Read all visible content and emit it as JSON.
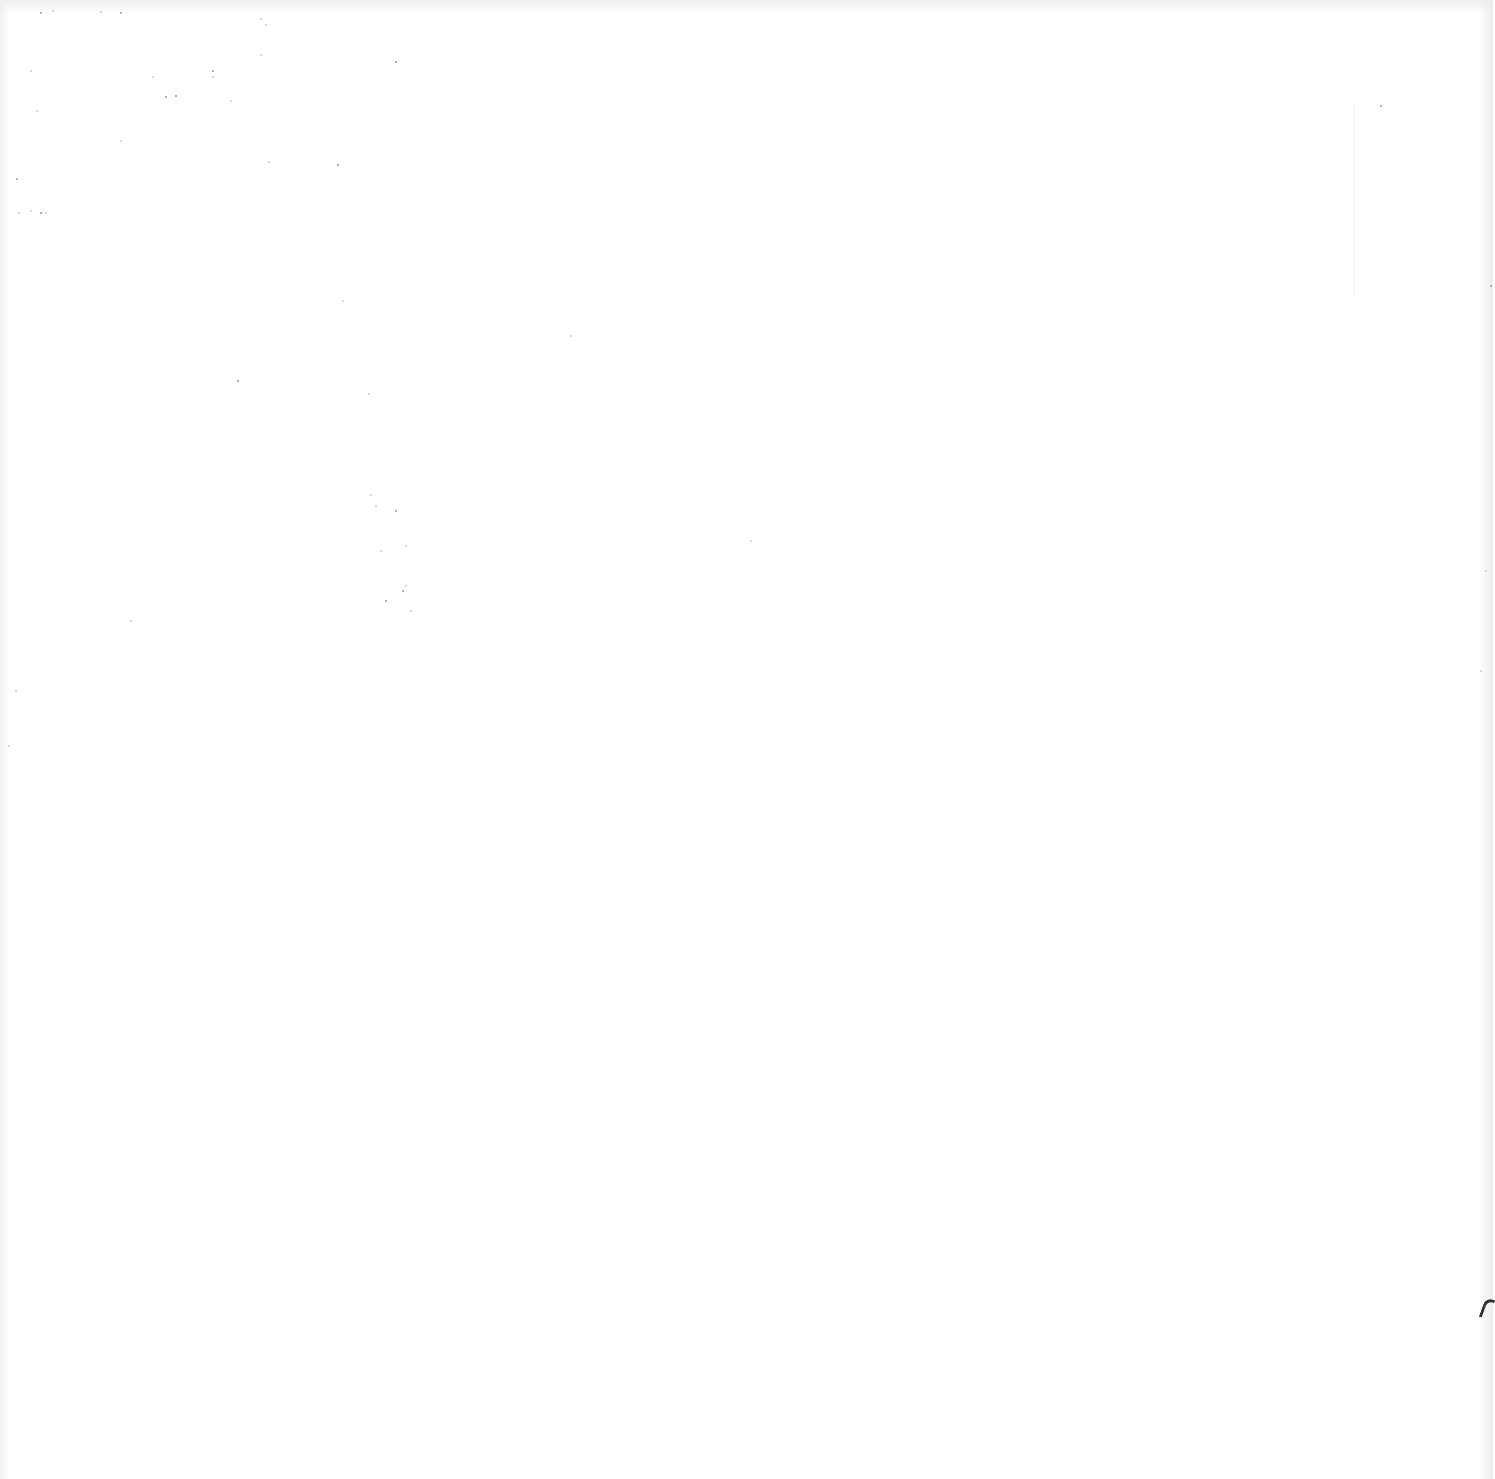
{
  "page": {
    "type": "blank scanned page",
    "text_content": ""
  },
  "artifacts": {
    "specks": [
      [
        40,
        12
      ],
      [
        52,
        10
      ],
      [
        100,
        11
      ],
      [
        120,
        12
      ],
      [
        260,
        18
      ],
      [
        265,
        24
      ],
      [
        395,
        61
      ],
      [
        260,
        54
      ],
      [
        230,
        100
      ],
      [
        175,
        95
      ],
      [
        120,
        140
      ],
      [
        268,
        161
      ],
      [
        337,
        164
      ],
      [
        342,
        300
      ],
      [
        368,
        393
      ],
      [
        237,
        380
      ],
      [
        30,
        70
      ],
      [
        36,
        110
      ],
      [
        16,
        178
      ],
      [
        18,
        212
      ],
      [
        30,
        210
      ],
      [
        40,
        212
      ],
      [
        45,
        212
      ],
      [
        130,
        620
      ],
      [
        212,
        70
      ],
      [
        212,
        76
      ],
      [
        152,
        76
      ],
      [
        165,
        96
      ],
      [
        370,
        494
      ],
      [
        375,
        505
      ],
      [
        395,
        510
      ],
      [
        380,
        550
      ],
      [
        405,
        545
      ],
      [
        385,
        600
      ],
      [
        405,
        585
      ],
      [
        410,
        610
      ],
      [
        402,
        590
      ],
      [
        750,
        540
      ],
      [
        570,
        335
      ],
      [
        1490,
        285
      ],
      [
        1485,
        570
      ],
      [
        1480,
        670
      ],
      [
        1380,
        105
      ],
      [
        15,
        690
      ],
      [
        8,
        745
      ]
    ],
    "edge_mark": {
      "x": 1482,
      "y": 1298
    }
  }
}
